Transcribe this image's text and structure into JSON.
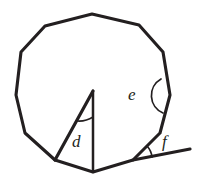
{
  "figure": {
    "title": "Polygon with marked angles d, e and f",
    "background_color": "#ffffff",
    "ink_color": "#231f20",
    "width": 198,
    "height": 193,
    "shape_name": "tridecagon",
    "shape_sides": 13
  },
  "labels": {
    "d": "d",
    "e": "e",
    "f": "f"
  },
  "label_positions": {
    "d": {
      "x": 72,
      "y": 147
    },
    "e": {
      "x": 128,
      "y": 100
    },
    "f": {
      "x": 162,
      "y": 147
    }
  },
  "geometry": {
    "polygon_points": "92,14 139,25 163,52 170,95 160,133 133,160 93,172 55,160 25,133 16,95 21,52 45,26 92,14",
    "triangle_apex": {
      "x": 93,
      "y": 91
    },
    "triangle_base_left": {
      "x": 55,
      "y": 160
    },
    "triangle_base_right": {
      "x": 93,
      "y": 172
    },
    "triangle_left_leg": "93,91 55,160",
    "triangle_vertical_leg": "93,91 93,172",
    "extended_line": "133,160 190,149",
    "polygon_side_to_f": "160,133 133,160"
  },
  "angle_marks": {
    "d_arc": {
      "description": "small arc at triangle apex spanning angle d",
      "path": "M 78,121 A 26,26 0 0 0 93,117"
    },
    "e_arc": {
      "description": "large arc at right polygon vertex spanning interior angle e",
      "path": "M 161,79 A 19,19 0 0 0 163,113"
    },
    "f_arc": {
      "description": "arc at lower-right vertex between polygon side and extended line",
      "path": "M 147,146 A 19,19 0 0 1 152,157"
    }
  },
  "annotations": {
    "d_meaning": "angle at apex of inscribed triangle",
    "e_meaning": "interior angle of the polygon",
    "f_meaning": "exterior angle between polygon side and extended line"
  }
}
